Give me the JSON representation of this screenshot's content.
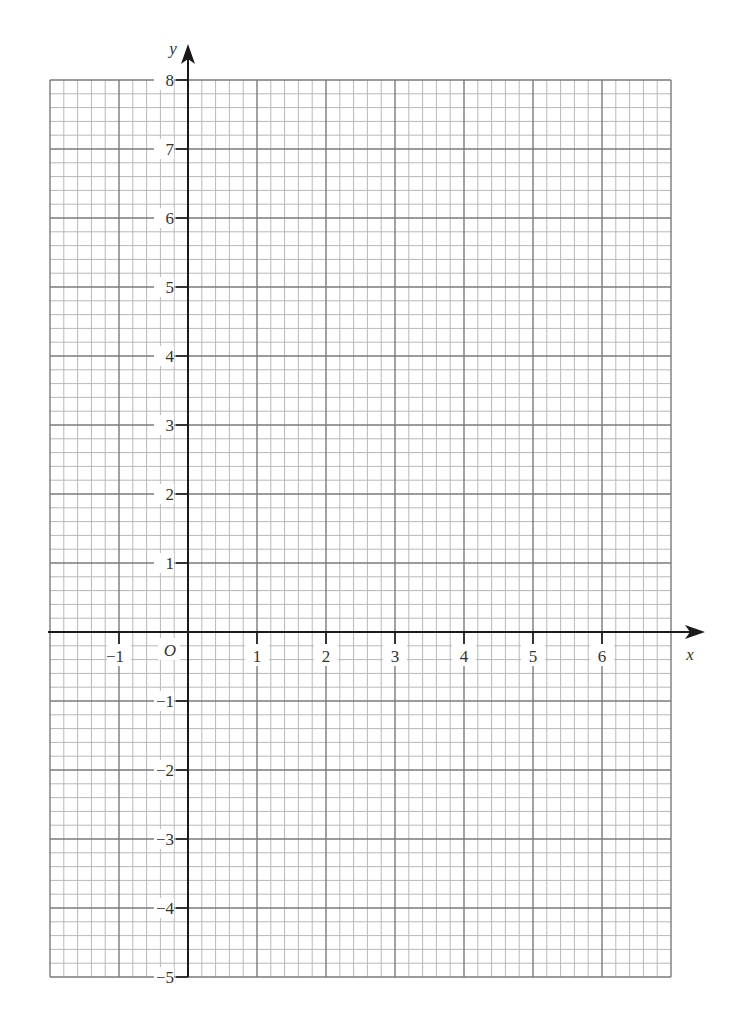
{
  "chart_data": {
    "type": "scatter",
    "title": "",
    "xlabel": "x",
    "ylabel": "y",
    "origin_label": "O",
    "xlim": [
      -2,
      7
    ],
    "ylim": [
      -5,
      8
    ],
    "x_ticks": [
      -1,
      1,
      2,
      3,
      4,
      5,
      6
    ],
    "y_ticks": [
      8,
      7,
      6,
      5,
      4,
      3,
      2,
      1,
      -1,
      -2,
      -3,
      -4,
      -5
    ],
    "x_tick_labels": [
      "−1",
      "1",
      "2",
      "3",
      "4",
      "5",
      "6"
    ],
    "y_tick_labels": [
      "8",
      "7",
      "6",
      "5",
      "4",
      "3",
      "2",
      "1",
      "−1",
      "−2",
      "−3",
      "−4",
      "−5"
    ],
    "grid": true,
    "minor_divisions_per_unit": 5,
    "series": [],
    "legend": null
  },
  "colors": {
    "axis": "#1a1a1a",
    "major_grid": "#7a7a7a",
    "minor_grid": "#b8b8b8",
    "label": "#333333"
  },
  "geometry": {
    "origin_px": [
      188,
      632
    ],
    "unit_px": 69
  }
}
